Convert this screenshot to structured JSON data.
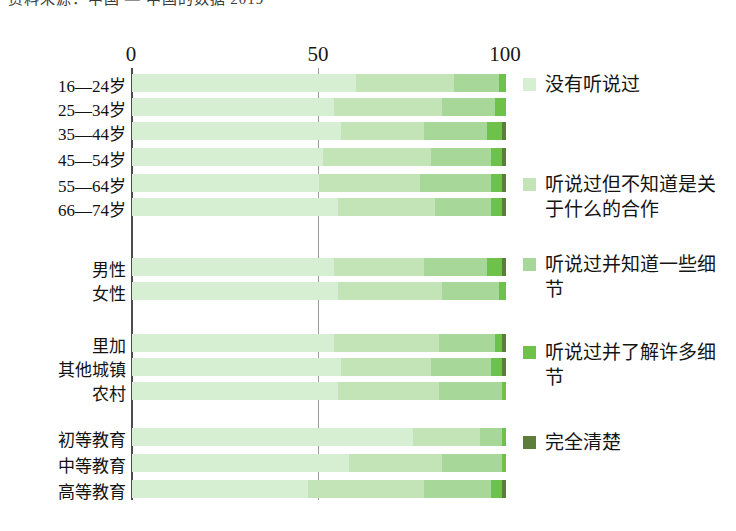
{
  "page": {
    "clipped_top_text": "资料来源：中国 — 中国的数据 2019"
  },
  "chart_data": {
    "type": "bar",
    "orientation": "horizontal",
    "stacked": true,
    "normalized_percent": true,
    "title": "",
    "xlabel": "",
    "ylabel": "",
    "xlim": [
      0,
      100
    ],
    "xticks": [
      "0",
      "50",
      "100"
    ],
    "xtick_values": [
      0,
      50,
      100
    ],
    "grid": false,
    "legend_position": "right",
    "series": [
      {
        "name": "没有听说过",
        "color": "#d6efd2",
        "values": [
          60,
          54,
          56,
          51,
          50,
          55,
          54,
          55,
          54,
          56,
          55,
          75,
          58,
          47
        ]
      },
      {
        "name": "听说过但不知道是关于什么的合作",
        "color": "#c2e4b6",
        "values": [
          26,
          29,
          22,
          29,
          27,
          26,
          24,
          28,
          28,
          24,
          27,
          18,
          25,
          31
        ]
      },
      {
        "name": "听说过并知道一些细节",
        "color": "#a8d79a",
        "values": [
          12,
          14,
          17,
          16,
          19,
          15,
          17,
          15,
          15,
          16,
          17,
          6,
          16,
          18
        ]
      },
      {
        "name": "听说过并了解许多细节",
        "color": "#6ec24a",
        "values": [
          2,
          3,
          4,
          3,
          3,
          3,
          4,
          2,
          2,
          3,
          1,
          1,
          1,
          3
        ]
      },
      {
        "name": "完全清楚",
        "color": "#5f7d3a",
        "values": [
          0,
          0,
          1,
          1,
          1,
          1,
          1,
          0,
          1,
          1,
          0,
          0,
          0,
          1
        ]
      }
    ],
    "groups": [
      {
        "name": "年龄",
        "categories": [
          "16—24岁",
          "25—34岁",
          "35—44岁",
          "45—54岁",
          "55—64岁",
          "66—74岁"
        ]
      },
      {
        "name": "性别",
        "categories": [
          "男性",
          "女性"
        ]
      },
      {
        "name": "地区",
        "categories": [
          "里加",
          "其他城镇",
          "农村"
        ]
      },
      {
        "name": "教育",
        "categories": [
          "初等教育",
          "中等教育",
          "高等教育"
        ]
      }
    ],
    "categories": [
      "16—24岁",
      "25—34岁",
      "35—44岁",
      "45—54岁",
      "55—64岁",
      "66—74岁",
      "男性",
      "女性",
      "里加",
      "其他城镇",
      "农村",
      "初等教育",
      "中等教育",
      "高等教育"
    ]
  },
  "legend": {
    "items": [
      {
        "label": "没有听说过",
        "color": "#d6efd2",
        "top": 0
      },
      {
        "label": "听说过但不知道是关于什么的合作",
        "color": "#c2e4b6",
        "top": 100
      },
      {
        "label": "听说过并知道一些细节",
        "color": "#a8d79a",
        "top": 180
      },
      {
        "label": "听说过并了解许多细节",
        "color": "#6ec24a",
        "top": 268
      },
      {
        "label": "完全清楚",
        "color": "#5f7d3a",
        "top": 358
      }
    ]
  },
  "axis": {
    "ticks": [
      {
        "label": "0",
        "x": 131
      },
      {
        "label": "50",
        "x": 318
      },
      {
        "label": "100",
        "x": 505
      }
    ]
  },
  "layout": {
    "plot_left": 132,
    "plot_right": 506,
    "px_per_unit": 3.74,
    "row_height": 18,
    "row_tops": [
      74,
      98,
      122,
      148,
      174,
      198,
      258,
      282,
      334,
      358,
      382,
      428,
      454,
      480
    ]
  }
}
